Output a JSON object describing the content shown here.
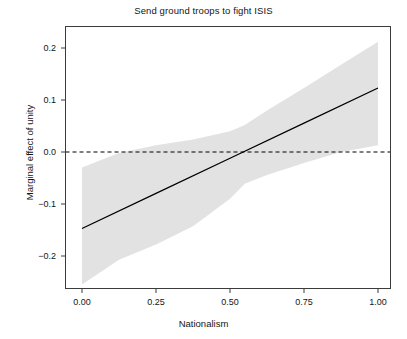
{
  "chart_data": {
    "type": "line",
    "title": "Send ground troops to fight ISIS",
    "xlabel": "Nationalism",
    "ylabel": "Marginal effect of unity",
    "xlim": [
      0.0,
      1.0
    ],
    "ylim": [
      -0.265,
      0.235
    ],
    "grid": false,
    "legend": null,
    "xticks": [
      0.0,
      0.25,
      0.5,
      0.75,
      1.0
    ],
    "xtick_labels": [
      "0.00",
      "0.25",
      "0.50",
      "0.75",
      "1.00"
    ],
    "yticks": [
      -0.2,
      -0.1,
      0.0,
      0.1,
      0.2
    ],
    "ytick_labels": [
      "−0.2",
      "−0.1",
      "0.0",
      "0.1",
      "0.2"
    ],
    "series": [
      {
        "name": "Marginal effect of unity",
        "kind": "line",
        "style": "solid",
        "color": "#000000",
        "x": [
          0.0,
          0.25,
          0.5,
          0.75,
          1.0
        ],
        "values": [
          -0.147,
          -0.0795,
          -0.012,
          0.0555,
          0.123
        ]
      },
      {
        "name": "Zero reference line",
        "kind": "hline",
        "style": "dashed",
        "color": "#000000",
        "x": [
          0.0,
          1.0
        ],
        "values": [
          0.0,
          0.0
        ]
      }
    ],
    "confidence_band": {
      "name": "95% confidence interval",
      "color": "#e2e2e2",
      "x": [
        0.0,
        0.125,
        0.25,
        0.375,
        0.5,
        0.55,
        0.625,
        0.75,
        0.875,
        1.0
      ],
      "lower": [
        -0.255,
        -0.207,
        -0.178,
        -0.143,
        -0.09,
        -0.061,
        -0.044,
        -0.021,
        0.0,
        0.013
      ],
      "upper": [
        -0.03,
        -0.002,
        0.013,
        0.024,
        0.04,
        0.052,
        0.08,
        0.123,
        0.168,
        0.212
      ]
    },
    "annotations": {
      "zero_crossing_x": 0.55
    }
  },
  "axes": {
    "frame_color": "#3b3b3b",
    "background": "#ffffff"
  }
}
